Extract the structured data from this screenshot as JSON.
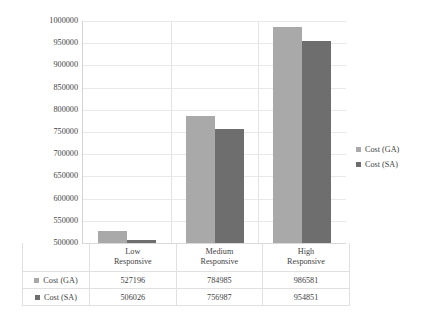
{
  "chart_data": {
    "type": "bar",
    "title": "",
    "xlabel": "",
    "ylabel": "Cost ($)",
    "categories": [
      "Low Responsive",
      "Medium Responsive",
      "High Responsive"
    ],
    "category_lines": [
      [
        "Low",
        "Responsive"
      ],
      [
        "Medium",
        "Responsive"
      ],
      [
        "High",
        "Responsive"
      ]
    ],
    "series": [
      {
        "name": "Cost (GA)",
        "color": "#a9a9a9",
        "values": [
          527196,
          784985,
          986581
        ]
      },
      {
        "name": "Cost (SA)",
        "color": "#6e6e6e",
        "values": [
          506026,
          756987,
          954851
        ]
      }
    ],
    "ylim": [
      500000,
      1000000
    ],
    "ytick_step": 50000,
    "yticks": [
      "500000",
      "550000",
      "600000",
      "650000",
      "700000",
      "750000",
      "800000",
      "850000",
      "900000",
      "950000",
      "1000000"
    ],
    "grid": true,
    "legend_position": "right",
    "data_table_visible": true
  },
  "legend": {
    "items": [
      {
        "label": "Cost (GA)",
        "swatch": "ga"
      },
      {
        "label": "Cost (SA)",
        "swatch": "sa"
      }
    ]
  },
  "table": {
    "corner": "",
    "header": [
      "Low Responsive",
      "Medium Responsive",
      "High Responsive"
    ],
    "rows": [
      {
        "label": "Cost (GA)",
        "swatch": "ga",
        "cells": [
          "527196",
          "784985",
          "986581"
        ]
      },
      {
        "label": "Cost (SA)",
        "swatch": "sa",
        "cells": [
          "506026",
          "756987",
          "954851"
        ]
      }
    ]
  },
  "colors": {
    "series_ga": "#a9a9a9",
    "series_sa": "#6e6e6e",
    "gridline": "#e9e9e9",
    "text": "#3f3f3f",
    "table_border": "#e0e0e0"
  }
}
